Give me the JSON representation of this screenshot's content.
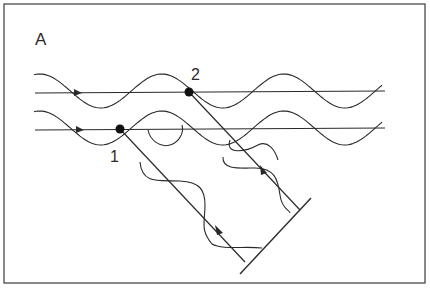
{
  "figure": {
    "panel_label": "A",
    "point_labels": [
      "1",
      "2"
    ]
  }
}
